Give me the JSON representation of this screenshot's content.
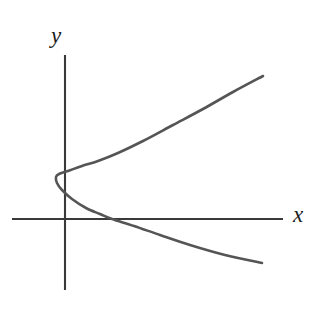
{
  "figure": {
    "background_color": "#ffffff",
    "axis_color": "#3a3a3a",
    "curve_color": "#555555",
    "label_color": "#1c1c1c",
    "y_axis_label": "y",
    "x_axis_label": "x"
  },
  "chart_data": {
    "type": "line",
    "title": "",
    "xlabel": "x",
    "ylabel": "y",
    "subtitle": "",
    "annotations": [],
    "legend": [],
    "grid": false,
    "axes": {
      "origin_px": [
        65,
        219
      ],
      "x_axis_px": {
        "x_start": 12,
        "x_end": 283,
        "y": 219
      },
      "y_axis_px": {
        "y_start": 55,
        "y_end": 290,
        "x": 65
      },
      "x_axis_arrow": false,
      "y_axis_arrow": false,
      "tick_labels_x": [],
      "tick_labels_y": []
    },
    "series": [
      {
        "name": "rightward-opening parabola",
        "shape": "parabola",
        "opens": "right",
        "vertex_px": [
          56,
          177
        ],
        "axis_of_symmetry_y_px": 170,
        "x_intercept_px": [
          112,
          219
        ],
        "endpoints_px": [
          [
            263,
            76
          ],
          [
            262,
            263
          ]
        ],
        "points_px": [
          [
            263,
            76
          ],
          [
            233,
            92
          ],
          [
            203,
            109
          ],
          [
            173,
            125
          ],
          [
            143,
            141
          ],
          [
            118,
            153
          ],
          [
            98,
            161
          ],
          [
            82,
            166
          ],
          [
            68,
            171
          ],
          [
            59,
            174
          ],
          [
            56,
            177
          ],
          [
            57,
            183
          ],
          [
            62,
            190
          ],
          [
            72,
            199
          ],
          [
            86,
            208
          ],
          [
            100,
            214
          ],
          [
            112,
            219
          ],
          [
            134,
            226
          ],
          [
            160,
            235
          ],
          [
            190,
            245
          ],
          [
            225,
            255
          ],
          [
            262,
            263
          ]
        ]
      }
    ]
  }
}
